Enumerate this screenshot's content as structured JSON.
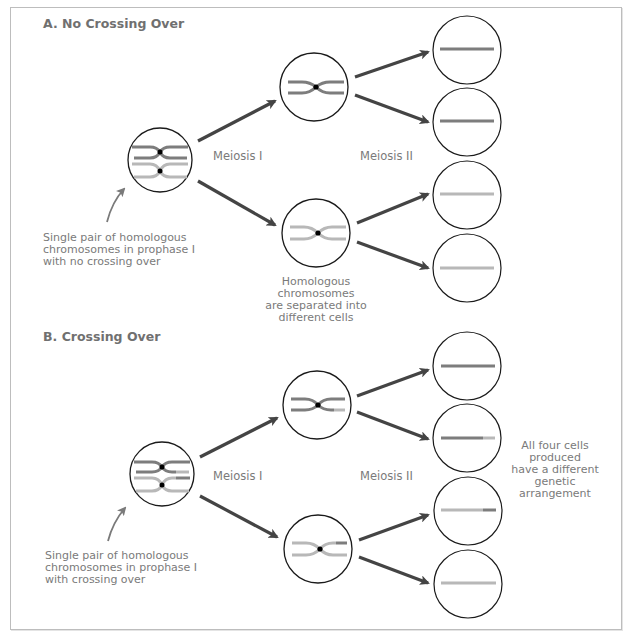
{
  "colors": {
    "dark_chromosome": "#7d7d7d",
    "light_chromosome": "#b8b8b8",
    "arrow": "#444444",
    "cell_outline": "#1a1a1a",
    "text": "#7a7a7a",
    "frame": "#bdbdbd"
  },
  "sections": [
    {
      "title": "A. No Crossing Over",
      "stage_labels": {
        "meiosis1": "Meiosis I",
        "meiosis2": "Meiosis II"
      },
      "initial_caption": "Single pair of homologous chromosomes in prophase I with no crossing over",
      "initial_caption_lines": [
        "Single pair of homologous",
        "chromosomes in prophase I",
        "with no crossing over"
      ],
      "middle_caption_lines": [
        "Homologous",
        "chromosomes",
        "are separated into",
        "different cells"
      ],
      "cells_final": [
        "dark",
        "dark",
        "light",
        "light"
      ]
    },
    {
      "title": "B. Crossing Over",
      "stage_labels": {
        "meiosis1": "Meiosis I",
        "meiosis2": "Meiosis II"
      },
      "initial_caption_lines": [
        "Single pair of homologous",
        "chromosomes in prophase I",
        "with crossing over"
      ],
      "right_caption_lines": [
        "All four cells",
        "produced",
        "have a different",
        "genetic",
        "arrangement"
      ],
      "cells_final": [
        "dark",
        "dark with light tip",
        "light with dark tip",
        "light"
      ]
    }
  ]
}
